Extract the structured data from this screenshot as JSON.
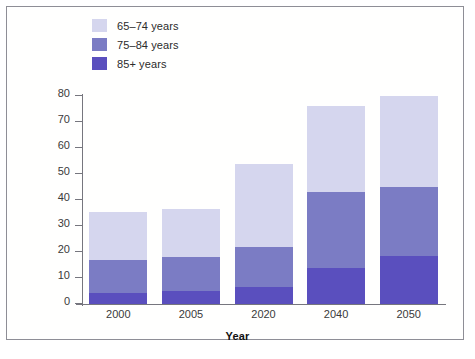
{
  "chart_data": {
    "type": "bar",
    "subtype": "stacked-bar-vertical",
    "title": "",
    "xlabel": "Year",
    "ylabel": "Millions of People",
    "categories": [
      "2000",
      "2005",
      "2020",
      "2040",
      "2050"
    ],
    "ylim": [
      0,
      80
    ],
    "yticks": [
      0,
      10,
      20,
      30,
      40,
      50,
      60,
      70,
      80
    ],
    "ytick_labels": [
      "0",
      "10",
      "20",
      "30",
      "40",
      "50",
      "60",
      "70",
      "80"
    ],
    "grid": false,
    "legend_position": "top-left",
    "stack_order_bottom_to_top": [
      "85+ years",
      "75–84 years",
      "65–74 years"
    ],
    "series": [
      {
        "name": "65–74 years",
        "color": "#d5d6ee",
        "values": [
          18.3,
          18.6,
          31.7,
          33.0,
          35.0
        ]
      },
      {
        "name": "75–84 years",
        "color": "#7b7cc4",
        "values": [
          12.8,
          12.9,
          15.4,
          29.0,
          26.5
        ]
      },
      {
        "name": "85+ years",
        "color": "#5a4fbe",
        "values": [
          4.2,
          5.0,
          6.6,
          14.0,
          18.5
        ]
      }
    ],
    "totals": [
      35.3,
      36.5,
      53.7,
      76.0,
      80.0
    ]
  },
  "legend": {
    "items": [
      {
        "label": "65–74 years",
        "color": "#d5d6ee"
      },
      {
        "label": "75–84 years",
        "color": "#7b7cc4"
      },
      {
        "label": "85+ years",
        "color": "#5a4fbe"
      }
    ]
  },
  "axes": {
    "y": {
      "label": "Millions of People",
      "ticks": [
        "80",
        "70",
        "60",
        "50",
        "40",
        "30",
        "20",
        "10",
        "0"
      ]
    },
    "x": {
      "label": "Year",
      "ticks": [
        "2000",
        "2005",
        "2020",
        "2040",
        "2050"
      ]
    }
  }
}
